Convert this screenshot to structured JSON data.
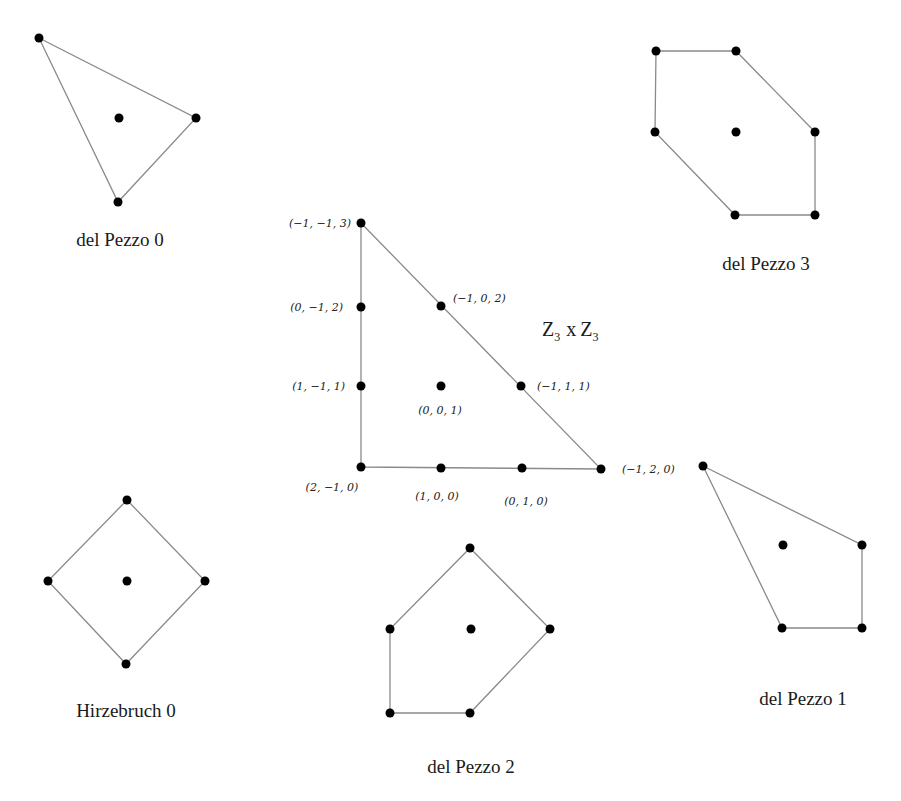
{
  "diagrams": {
    "dp0": {
      "caption": "del Pezzo 0",
      "vertices": [
        [
          39,
          38
        ],
        [
          196,
          118
        ],
        [
          118,
          202
        ]
      ],
      "interior": [
        [
          119,
          118
        ]
      ],
      "caption_pos": [
        120,
        246
      ]
    },
    "dp3": {
      "caption": "del Pezzo 3",
      "vertices": [
        [
          656,
          51
        ],
        [
          736,
          51
        ],
        [
          815,
          132
        ],
        [
          815,
          215
        ],
        [
          735,
          215
        ],
        [
          655,
          132
        ]
      ],
      "interior": [
        [
          736,
          132
        ]
      ],
      "caption_pos": [
        766,
        270
      ]
    },
    "dp1": {
      "caption": "del Pezzo 1",
      "vertices": [
        [
          703,
          466
        ],
        [
          862,
          545
        ],
        [
          862,
          628
        ],
        [
          782,
          628
        ]
      ],
      "interior": [
        [
          783,
          545
        ]
      ],
      "caption_pos": [
        803,
        705
      ]
    },
    "dp2": {
      "caption": "del Pezzo 2",
      "vertices": [
        [
          470,
          548
        ],
        [
          550,
          629
        ],
        [
          470,
          713
        ],
        [
          390,
          713
        ],
        [
          390,
          629
        ]
      ],
      "interior": [
        [
          471,
          629
        ]
      ],
      "caption_pos": [
        471,
        773
      ]
    },
    "f0": {
      "caption": "Hirzebruch 0",
      "vertices": [
        [
          127,
          500
        ],
        [
          205,
          581
        ],
        [
          126,
          664
        ],
        [
          48,
          581
        ]
      ],
      "interior": [
        [
          127,
          581
        ]
      ],
      "caption_pos": [
        126,
        717
      ]
    },
    "z3z3": {
      "group_label": "Z",
      "group_sub": "3",
      "group_times": "x",
      "group_label2": "Z",
      "group_sub2": "3",
      "vertices": [
        [
          361,
          223
        ],
        [
          601,
          469
        ],
        [
          361,
          467
        ]
      ],
      "points": [
        {
          "xy": [
            361,
            223
          ],
          "label": "(−1, −1, 3)",
          "lx": 351,
          "ly": 227,
          "anchor": "end"
        },
        {
          "xy": [
            361,
            307
          ],
          "label": "(0, −1, 2)",
          "lx": 343,
          "ly": 311,
          "anchor": "end"
        },
        {
          "xy": [
            441,
            306
          ],
          "label": "(−1, 0, 2)",
          "lx": 453,
          "ly": 302,
          "anchor": "start"
        },
        {
          "xy": [
            361,
            386
          ],
          "label": "(1, −1, 1)",
          "lx": 345,
          "ly": 390,
          "anchor": "end"
        },
        {
          "xy": [
            441,
            386
          ],
          "label": "(0, 0, 1)",
          "lx": 440,
          "ly": 414,
          "anchor": "middle"
        },
        {
          "xy": [
            521,
            386
          ],
          "label": "(−1, 1, 1)",
          "lx": 537,
          "ly": 390,
          "anchor": "start"
        },
        {
          "xy": [
            361,
            467
          ],
          "label": "(2, −1, 0)",
          "lx": 332,
          "ly": 491,
          "anchor": "middle"
        },
        {
          "xy": [
            441,
            468
          ],
          "label": "(1, 0, 0)",
          "lx": 437,
          "ly": 500,
          "anchor": "middle"
        },
        {
          "xy": [
            522,
            468
          ],
          "label": "(0, 1, 0)",
          "lx": 526,
          "ly": 505,
          "anchor": "middle"
        },
        {
          "xy": [
            601,
            469
          ],
          "label": "(−1, 2, 0)",
          "lx": 622,
          "ly": 473,
          "anchor": "start"
        }
      ]
    }
  },
  "colors": {
    "edge": "#8a8a8a",
    "point": "#000000",
    "text": "#1a1a1a"
  }
}
